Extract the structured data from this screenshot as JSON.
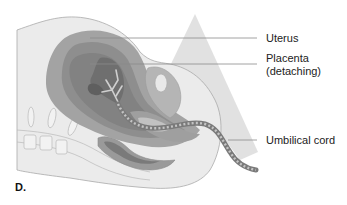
{
  "figure": {
    "panel_letter": "D.",
    "labels": {
      "uterus": "Uterus",
      "placenta_line1": "Placenta",
      "placenta_line2": "(detaching)",
      "umbilical_cord": "Umbilical cord"
    },
    "colors": {
      "background": "#ffffff",
      "body_light": "#ebebeb",
      "body_outline": "#a9a9a9",
      "uterus_wall": "#a3a3a3",
      "uterus_inner": "#8e8e8e",
      "placenta": "#6f6f6f",
      "placenta_vessels": "#cfcfcf",
      "cord": "#7a7a7a",
      "cord_stripe": "#c4c4c4",
      "leader_line": "#8a8a8a",
      "panel_triangle": "#dcdcdc",
      "text": "#222222"
    }
  }
}
